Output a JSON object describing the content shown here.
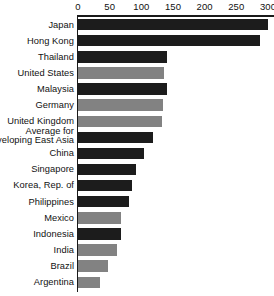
{
  "chart_data": {
    "type": "bar",
    "orientation": "horizontal",
    "title": "",
    "subtitle": "",
    "xlabel": "",
    "ylabel": "",
    "xlim": [
      0,
      300
    ],
    "grid": false,
    "legend": "none",
    "axis_position": "top",
    "xticks": [
      0,
      50,
      100,
      150,
      200,
      250,
      300
    ],
    "xtick_labels": [
      "0",
      "50",
      "100",
      "150",
      "200",
      "250",
      "300"
    ],
    "categories": [
      "Japan",
      "Hong Kong",
      "Thailand",
      "United States",
      "Malaysia",
      "Germany",
      "United Kingdom",
      "Average for developing East Asia",
      "China",
      "Singapore",
      "Korea, Rep. of",
      "Philippines",
      "Mexico",
      "Indonesia",
      "India",
      "Brazil",
      "Argentina"
    ],
    "values": [
      300,
      288,
      140,
      136,
      140,
      134,
      133,
      118,
      105,
      92,
      86,
      80,
      68,
      68,
      62,
      47,
      35
    ],
    "bar_colors": [
      "#1c1c1c",
      "#1c1c1c",
      "#1c1c1c",
      "#828282",
      "#1c1c1c",
      "#828282",
      "#828282",
      "#1c1c1c",
      "#1c1c1c",
      "#1c1c1c",
      "#1c1c1c",
      "#1c1c1c",
      "#828282",
      "#1c1c1c",
      "#828282",
      "#828282",
      "#828282"
    ]
  },
  "colors": {
    "dark_bar": "#1c1c1c",
    "light_bar": "#828282",
    "axis": "#1a1a1a",
    "background": "#ffffff",
    "text": "#111111"
  }
}
